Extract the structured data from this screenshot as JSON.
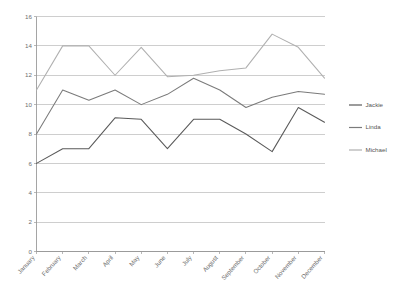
{
  "chart_data": {
    "type": "line",
    "title": "",
    "xlabel": "",
    "ylabel": "",
    "ylim": [
      0,
      16
    ],
    "ytick_step": 2,
    "yticks": [
      0,
      2,
      4,
      6,
      8,
      10,
      12,
      14,
      16
    ],
    "grid": true,
    "legend_position": "right",
    "categories": [
      "January",
      "February",
      "March",
      "April",
      "May",
      "June",
      "July",
      "August",
      "September",
      "October",
      "November",
      "December"
    ],
    "series": [
      {
        "name": "Jackie",
        "color": "#5a5a5a",
        "values": [
          6.0,
          7.0,
          7.0,
          9.1,
          9.0,
          7.0,
          9.0,
          9.0,
          8.0,
          6.8,
          9.8,
          8.8
        ]
      },
      {
        "name": "Linda",
        "color": "#7b7b7b",
        "values": [
          8.0,
          11.0,
          10.3,
          11.0,
          10.0,
          10.7,
          11.8,
          11.0,
          9.8,
          10.5,
          10.9,
          10.7
        ]
      },
      {
        "name": "Michael",
        "color": "#b0b0b0",
        "values": [
          11.0,
          14.0,
          14.0,
          12.0,
          13.9,
          11.9,
          12.0,
          12.3,
          12.5,
          14.8,
          13.9,
          11.8
        ]
      }
    ]
  },
  "legend": {
    "entries": [
      {
        "label": "Jackie"
      },
      {
        "label": "Linda"
      },
      {
        "label": "Michael"
      }
    ]
  },
  "axes": {
    "y_tick_labels": [
      "16",
      "14",
      "12",
      "10",
      "8",
      "6",
      "4",
      "2",
      "0"
    ],
    "x_tick_labels": [
      "January",
      "February",
      "March",
      "April",
      "May",
      "June",
      "July",
      "August",
      "September",
      "October",
      "November",
      "December"
    ]
  }
}
